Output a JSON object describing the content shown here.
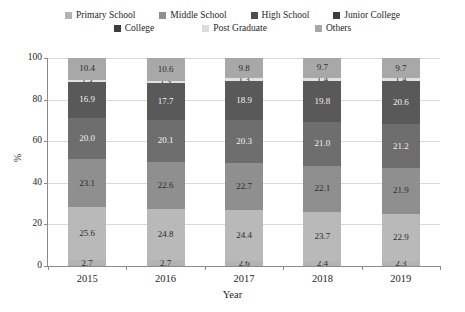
{
  "chart_data": {
    "type": "bar",
    "stacked": true,
    "title": "",
    "xlabel": "Year",
    "ylabel": "%",
    "categories": [
      "2015",
      "2016",
      "2017",
      "2018",
      "2019"
    ],
    "ylim": [
      0,
      100
    ],
    "yticks": [
      0,
      20,
      40,
      60,
      80,
      100
    ],
    "grid": true,
    "legend_position": "top",
    "series": [
      {
        "name": "Primary School",
        "color": "#b3b3b3",
        "values": [
          2.7,
          2.7,
          2.6,
          2.4,
          2.3
        ]
      },
      {
        "name": "Middle School",
        "color": "#b9b9b9",
        "values": [
          25.6,
          24.8,
          24.4,
          23.7,
          22.9
        ]
      },
      {
        "name": "High School",
        "color": "#8f8f8f",
        "values": [
          23.1,
          22.6,
          22.7,
          22.1,
          21.9
        ]
      },
      {
        "name": "Junior College",
        "color": "#6e6e6e",
        "values": [
          20.0,
          20.1,
          20.3,
          21.0,
          21.2
        ]
      },
      {
        "name": "College",
        "color": "#595959",
        "values": [
          16.9,
          17.7,
          18.9,
          19.8,
          20.6
        ]
      },
      {
        "name": "Post Graduate",
        "color": "#e2e2e2",
        "values": [
          1.3,
          1.3,
          1.3,
          1.4,
          1.4
        ]
      },
      {
        "name": "Others",
        "color": "#a8a8a8",
        "values": [
          10.4,
          10.6,
          9.8,
          9.7,
          9.7
        ]
      }
    ]
  },
  "legend": {
    "rows": [
      [
        {
          "label": "Primary School",
          "color": "#b3b3b3"
        },
        {
          "label": "Middle School",
          "color": "#8f8f8f"
        },
        {
          "label": "High School",
          "color": "#4d4d4d"
        },
        {
          "label": "Junior College",
          "color": "#3d3d3d"
        }
      ],
      [
        {
          "label": "College",
          "color": "#3d3d3d"
        },
        {
          "label": "Post Graduate",
          "color": "#dcdcdc"
        },
        {
          "label": "Others",
          "color": "#a8a8a8"
        }
      ]
    ]
  },
  "axes": {
    "ylabel": "%",
    "xlabel": "Year",
    "ytick_labels": [
      "0",
      "20",
      "40",
      "60",
      "80",
      "100"
    ],
    "xtick_labels": [
      "2015",
      "2016",
      "2017",
      "2018",
      "2019"
    ]
  }
}
